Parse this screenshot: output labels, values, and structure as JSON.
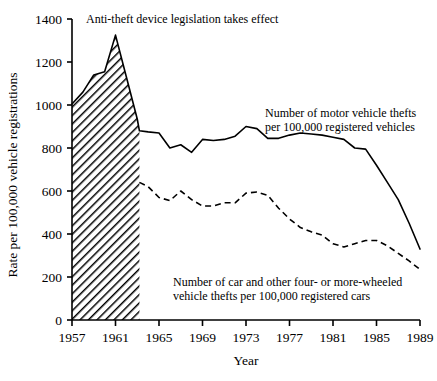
{
  "chart_data": {
    "type": "line",
    "title": "",
    "xlabel": "Year",
    "ylabel": "Rate per 100,000 vehicle registrations",
    "xlim": [
      1957,
      1989
    ],
    "ylim": [
      0,
      1400
    ],
    "grid": false,
    "legend_position": "inline-annotations",
    "xticks": [
      "1957",
      "1961",
      "1965",
      "1969",
      "1973",
      "1977",
      "1981",
      "1985",
      "1989"
    ],
    "xtick_values": [
      1957,
      1961,
      1965,
      1969,
      1973,
      1977,
      1981,
      1985,
      1989
    ],
    "yticks": [
      "0",
      "200",
      "400",
      "600",
      "800",
      "1000",
      "1200",
      "1400"
    ],
    "ytick_values": [
      0,
      200,
      400,
      600,
      800,
      1000,
      1200,
      1400
    ],
    "annotations": [
      {
        "name": "legislation-annotation",
        "text": "Anti-theft device legislation takes effect",
        "x": 1958.0,
        "y": 1395
      }
    ],
    "shaded_region": {
      "name": "pre-legislation-shaded-area",
      "fill": "hatch-diagonal",
      "x_start": 1957,
      "x_end": 1963.2,
      "series": "motor_vehicle_thefts"
    },
    "series": [
      {
        "name": "motor_vehicle_thefts",
        "label": "Number of motor vehicle thefts per 100,000 registered vehicles",
        "label_lines": [
          "Number of motor vehicle thefts",
          "per 100,000 registered vehicles"
        ],
        "label_x": 1976.0,
        "label_y": 1040,
        "style": "solid",
        "color": "#000000",
        "x": [
          1957,
          1958,
          1959,
          1960,
          1961,
          1962,
          1963,
          1963.2,
          1964,
          1965,
          1966,
          1967,
          1968,
          1969,
          1970,
          1971,
          1972,
          1973,
          1974,
          1975,
          1976,
          1977,
          1978,
          1979,
          1980,
          1981,
          1982,
          1983,
          1984,
          1985,
          1986,
          1987,
          1988,
          1989
        ],
        "values": [
          1005,
          1060,
          1140,
          1155,
          1325,
          1130,
          935,
          880,
          875,
          870,
          800,
          815,
          780,
          840,
          835,
          840,
          855,
          900,
          890,
          845,
          845,
          860,
          870,
          865,
          860,
          850,
          840,
          800,
          795,
          720,
          640,
          560,
          450,
          330
        ]
      },
      {
        "name": "car_and_four_wheeled_thefts",
        "label": "Number of car and other four- or more-wheeled vehicle thefts per 100,000 registered cars",
        "label_lines": [
          "Number of car and other four- or more-wheeled",
          "vehicle thefts per 100,000 registered cars"
        ],
        "label_x": 1968.0,
        "label_y": 300,
        "style": "dashed",
        "color": "#000000",
        "x": [
          1963.2,
          1964,
          1965,
          1966,
          1967,
          1968,
          1969,
          1970,
          1971,
          1972,
          1973,
          1974,
          1975,
          1976,
          1977,
          1978,
          1979,
          1980,
          1981,
          1982,
          1983,
          1984,
          1985,
          1986,
          1987,
          1988,
          1989
        ],
        "values": [
          640,
          620,
          570,
          555,
          600,
          560,
          530,
          530,
          545,
          545,
          590,
          595,
          580,
          520,
          470,
          430,
          410,
          395,
          355,
          340,
          355,
          370,
          370,
          345,
          310,
          275,
          235
        ]
      }
    ]
  }
}
